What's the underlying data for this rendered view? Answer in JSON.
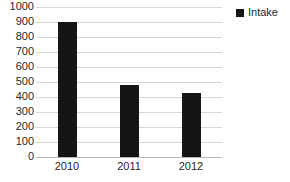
{
  "chart_data": {
    "type": "bar",
    "title": "",
    "xlabel": "",
    "ylabel": "",
    "categories": [
      "2010",
      "2011",
      "2012"
    ],
    "values": [
      900,
      480,
      425
    ],
    "series": [
      {
        "name": "Intake",
        "values": [
          900,
          480,
          425
        ]
      }
    ],
    "ylim": [
      0,
      1000
    ],
    "ytick_step": 100,
    "yticks": [
      "1000",
      "900",
      "800",
      "700",
      "600",
      "500",
      "400",
      "300",
      "200",
      "100",
      "0"
    ],
    "ytick_values": [
      1000,
      900,
      800,
      700,
      600,
      500,
      400,
      300,
      200,
      100,
      0
    ],
    "grid": true,
    "grid_axis": "y",
    "legend": {
      "position": "top-right",
      "entries": [
        {
          "label": "Intake",
          "color": "#151515",
          "marker": "square"
        }
      ]
    },
    "colors": {
      "bar": "#151515",
      "gridline": "#d6d6d6",
      "axis": "#b8b8b8",
      "text": "#1f1f1f",
      "background": "#ffffff"
    }
  }
}
